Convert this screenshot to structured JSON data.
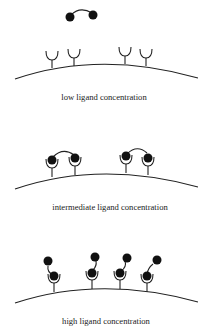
{
  "panels": [
    {
      "caption": "low ligand concentration",
      "state": "free ligand dimer above unbound receptors",
      "receptors": 4,
      "bound_ligands": 0
    },
    {
      "caption": "intermediate ligand concentration",
      "state": "each ligand dimer crosslinks two receptors",
      "receptors": 4,
      "bound_ligands": 2
    },
    {
      "caption": "high ligand concentration",
      "state": "each receptor bound by a separate ligand dimer (one end bound)",
      "receptors": 4,
      "bound_ligands": 4
    }
  ],
  "colors": {
    "ink": "#111111",
    "background": "#ffffff"
  }
}
